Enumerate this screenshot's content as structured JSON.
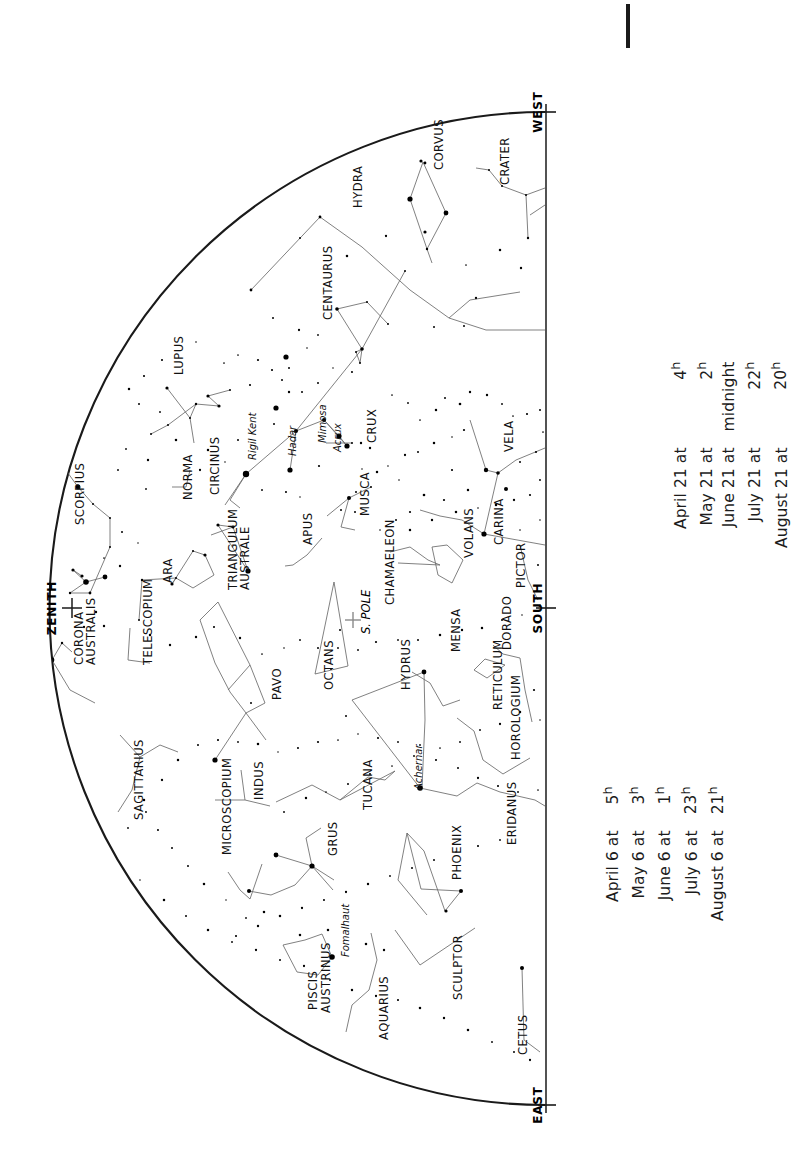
{
  "chart": {
    "compass": {
      "west": "WEST",
      "south": "SOUTH",
      "east": "EAST"
    },
    "zenith_label": "ZENITH",
    "pole_label": "S. POLE",
    "horizon_line_color": "#1a1a1a",
    "star_color": "#000000",
    "constellation_line_color": "#555555"
  },
  "constellations": [
    {
      "name": "HYDRA",
      "x": 362,
      "y": 208,
      "rot": -90
    },
    {
      "name": "CORVUS",
      "x": 443,
      "y": 170,
      "rot": -90
    },
    {
      "name": "CRATER",
      "x": 509,
      "y": 185,
      "rot": -90
    },
    {
      "name": "CENTAURUS",
      "x": 332,
      "y": 320,
      "rot": -90
    },
    {
      "name": "LUPUS",
      "x": 183,
      "y": 375,
      "rot": -90
    },
    {
      "name": "CRUX",
      "x": 376,
      "y": 443,
      "rot": -90
    },
    {
      "name": "MUSCA",
      "x": 369,
      "y": 516,
      "rot": -90
    },
    {
      "name": "CIRCINUS",
      "x": 219,
      "y": 495,
      "rot": -90
    },
    {
      "name": "NORMA",
      "x": 192,
      "y": 500,
      "rot": -90
    },
    {
      "name": "SCORPIUS",
      "x": 84,
      "y": 525,
      "rot": -90
    },
    {
      "name": "CORONA",
      "x": 83,
      "y": 665,
      "rot": -90
    },
    {
      "name": "AUSTRALIS",
      "x": 95,
      "y": 665,
      "rot": -90
    },
    {
      "name": "ARA",
      "x": 172,
      "y": 583,
      "rot": -90
    },
    {
      "name": "TELESCOPIUM",
      "x": 152,
      "y": 665,
      "rot": -90
    },
    {
      "name": "TRIANGULUM",
      "x": 237,
      "y": 590,
      "rot": -90
    },
    {
      "name": "AUSTRALE",
      "x": 249,
      "y": 590,
      "rot": -90
    },
    {
      "name": "APUS",
      "x": 312,
      "y": 545,
      "rot": -90
    },
    {
      "name": "CHAMAELEON",
      "x": 394,
      "y": 605,
      "rot": -90
    },
    {
      "name": "VELA",
      "x": 513,
      "y": 452,
      "rot": -90
    },
    {
      "name": "CARINA",
      "x": 503,
      "y": 545,
      "rot": -90
    },
    {
      "name": "VOLANS",
      "x": 473,
      "y": 558,
      "rot": -90
    },
    {
      "name": "PICTOR",
      "x": 525,
      "y": 588,
      "rot": -90
    },
    {
      "name": "MENSA",
      "x": 460,
      "y": 652,
      "rot": -90
    },
    {
      "name": "DORADO",
      "x": 511,
      "y": 650,
      "rot": -90
    },
    {
      "name": "HYDRUS",
      "x": 410,
      "y": 690,
      "rot": -90
    },
    {
      "name": "RETICULUM",
      "x": 502,
      "y": 710,
      "rot": -90
    },
    {
      "name": "HOROLOGIUM",
      "x": 520,
      "y": 760,
      "rot": -90
    },
    {
      "name": "ERIDANUS",
      "x": 516,
      "y": 845,
      "rot": -90
    },
    {
      "name": "OCTANS",
      "x": 333,
      "y": 690,
      "rot": -90
    },
    {
      "name": "PAVO",
      "x": 281,
      "y": 700,
      "rot": -90
    },
    {
      "name": "INDUS",
      "x": 263,
      "y": 800,
      "rot": -90
    },
    {
      "name": "TUCANA",
      "x": 372,
      "y": 810,
      "rot": -90
    },
    {
      "name": "MICROSCOPIUM",
      "x": 231,
      "y": 855,
      "rot": -90
    },
    {
      "name": "GRUS",
      "x": 337,
      "y": 856,
      "rot": -90
    },
    {
      "name": "SAGITTARIUS",
      "x": 143,
      "y": 820,
      "rot": -90
    },
    {
      "name": "PHOENIX",
      "x": 461,
      "y": 880,
      "rot": -90
    },
    {
      "name": "PISCIS",
      "x": 317,
      "y": 1010,
      "rot": -90
    },
    {
      "name": "AUSTRINUS",
      "x": 330,
      "y": 1013,
      "rot": -90
    },
    {
      "name": "AQUARIUS",
      "x": 388,
      "y": 1040,
      "rot": -90
    },
    {
      "name": "SCULPTOR",
      "x": 462,
      "y": 1000,
      "rot": -90
    },
    {
      "name": "CETUS",
      "x": 527,
      "y": 1055,
      "rot": -90
    }
  ],
  "named_stars": [
    {
      "name": "Rigil Kent",
      "x": 256,
      "y": 460
    },
    {
      "name": "Hadar",
      "x": 296,
      "y": 456
    },
    {
      "name": "Mimosa",
      "x": 326,
      "y": 443
    },
    {
      "name": "Acrux",
      "x": 341,
      "y": 452
    },
    {
      "name": "Achernar",
      "x": 422,
      "y": 790
    },
    {
      "name": "Fomalhaut",
      "x": 349,
      "y": 957
    }
  ],
  "legend": {
    "upper": {
      "rows": [
        {
          "date": "April 21 at",
          "time": "4",
          "suffix": "h"
        },
        {
          "date": "May 21 at",
          "time": "2",
          "suffix": "h"
        },
        {
          "date": "June 21 at",
          "time": "midnight",
          "suffix": ""
        },
        {
          "date": "July 21 at",
          "time": "22",
          "suffix": "h"
        },
        {
          "date": "August 21 at",
          "time": "20",
          "suffix": "h"
        }
      ]
    },
    "lower": {
      "rows": [
        {
          "date": "April 6 at",
          "time": "5",
          "suffix": "h"
        },
        {
          "date": "May 6 at",
          "time": "3",
          "suffix": "h"
        },
        {
          "date": "June 6 at",
          "time": "1",
          "suffix": "h"
        },
        {
          "date": "July 6 at",
          "time": "23",
          "suffix": "h"
        },
        {
          "date": "August 6 at",
          "time": "21",
          "suffix": "h"
        }
      ]
    }
  },
  "chart_data": {
    "type": "scatter",
    "xlabel": "",
    "ylabel": "",
    "note": "Semicircular all-sky map; horizon is the straight right edge running WEST (top) to EAST (bottom); SOUTH at its midpoint. ZENITH is marked on the curved western/left limb.",
    "stars": [
      {
        "x": 320,
        "y": 217,
        "mag": 1.4
      },
      {
        "x": 421,
        "y": 161,
        "mag": 1.6
      },
      {
        "x": 425,
        "y": 163,
        "mag": 1.4
      },
      {
        "x": 446,
        "y": 213,
        "mag": 2.4
      },
      {
        "x": 410,
        "y": 199,
        "mag": 2.6
      },
      {
        "x": 425,
        "y": 232,
        "mag": 1.6
      },
      {
        "x": 427,
        "y": 249,
        "mag": 1.2
      },
      {
        "x": 251,
        "y": 290,
        "mag": 1.4
      },
      {
        "x": 489,
        "y": 170,
        "mag": 1.0
      },
      {
        "x": 502,
        "y": 186,
        "mag": 1.0
      },
      {
        "x": 526,
        "y": 195,
        "mag": 1.0
      },
      {
        "x": 528,
        "y": 238,
        "mag": 1.2
      },
      {
        "x": 548,
        "y": 238,
        "mag": 1.0
      },
      {
        "x": 434,
        "y": 327,
        "mag": 1.0
      },
      {
        "x": 464,
        "y": 326,
        "mag": 1.0
      },
      {
        "x": 388,
        "y": 324,
        "mag": 1.0
      },
      {
        "x": 337,
        "y": 309,
        "mag": 1.8
      },
      {
        "x": 367,
        "y": 302,
        "mag": 1.0
      },
      {
        "x": 405,
        "y": 271,
        "mag": 1.0
      },
      {
        "x": 356,
        "y": 352,
        "mag": 1.0
      },
      {
        "x": 362,
        "y": 349,
        "mag": 1.8
      },
      {
        "x": 360,
        "y": 363,
        "mag": 1.0
      },
      {
        "x": 286,
        "y": 357,
        "mag": 2.6
      },
      {
        "x": 289,
        "y": 368,
        "mag": 1.0
      },
      {
        "x": 282,
        "y": 380,
        "mag": 1.0
      },
      {
        "x": 276,
        "y": 408,
        "mag": 2.6
      },
      {
        "x": 274,
        "y": 424,
        "mag": 1.0
      },
      {
        "x": 230,
        "y": 390,
        "mag": 1.0
      },
      {
        "x": 208,
        "y": 396,
        "mag": 1.6
      },
      {
        "x": 219,
        "y": 406,
        "mag": 1.6
      },
      {
        "x": 196,
        "y": 404,
        "mag": 1.2
      },
      {
        "x": 190,
        "y": 418,
        "mag": 1.0
      },
      {
        "x": 167,
        "y": 388,
        "mag": 1.6
      },
      {
        "x": 139,
        "y": 404,
        "mag": 1.0
      },
      {
        "x": 168,
        "y": 425,
        "mag": 1.0
      },
      {
        "x": 151,
        "y": 434,
        "mag": 1.0
      },
      {
        "x": 238,
        "y": 440,
        "mag": 1.0
      },
      {
        "x": 246,
        "y": 474,
        "mag": 3.2
      },
      {
        "x": 290,
        "y": 470,
        "mag": 2.6
      },
      {
        "x": 296,
        "y": 431,
        "mag": 2.0
      },
      {
        "x": 324,
        "y": 420,
        "mag": 2.0
      },
      {
        "x": 339,
        "y": 436,
        "mag": 2.6
      },
      {
        "x": 347,
        "y": 446,
        "mag": 2.6
      },
      {
        "x": 352,
        "y": 443,
        "mag": 1.0
      },
      {
        "x": 361,
        "y": 443,
        "mag": 1.2
      },
      {
        "x": 370,
        "y": 448,
        "mag": 1.2
      },
      {
        "x": 349,
        "y": 498,
        "mag": 2.0
      },
      {
        "x": 356,
        "y": 492,
        "mag": 1.0
      },
      {
        "x": 371,
        "y": 487,
        "mag": 1.0
      },
      {
        "x": 341,
        "y": 510,
        "mag": 1.0
      },
      {
        "x": 355,
        "y": 512,
        "mag": 1.0
      },
      {
        "x": 78,
        "y": 487,
        "mag": 2.4
      },
      {
        "x": 93,
        "y": 504,
        "mag": 1.0
      },
      {
        "x": 110,
        "y": 518,
        "mag": 1.0
      },
      {
        "x": 110,
        "y": 547,
        "mag": 1.0
      },
      {
        "x": 73,
        "y": 570,
        "mag": 1.6
      },
      {
        "x": 82,
        "y": 576,
        "mag": 1.6
      },
      {
        "x": 86,
        "y": 582,
        "mag": 2.8
      },
      {
        "x": 105,
        "y": 577,
        "mag": 2.4
      },
      {
        "x": 90,
        "y": 593,
        "mag": 1.4
      },
      {
        "x": 70,
        "y": 593,
        "mag": 1.2
      },
      {
        "x": 52,
        "y": 660,
        "mag": 2.4
      },
      {
        "x": 62,
        "y": 643,
        "mag": 1.2
      },
      {
        "x": 193,
        "y": 551,
        "mag": 1.0
      },
      {
        "x": 205,
        "y": 555,
        "mag": 1.6
      },
      {
        "x": 176,
        "y": 578,
        "mag": 1.0
      },
      {
        "x": 172,
        "y": 584,
        "mag": 1.6
      },
      {
        "x": 142,
        "y": 580,
        "mag": 1.2
      },
      {
        "x": 139,
        "y": 620,
        "mag": 1.0
      },
      {
        "x": 218,
        "y": 525,
        "mag": 1.6
      },
      {
        "x": 233,
        "y": 527,
        "mag": 1.6
      },
      {
        "x": 248,
        "y": 571,
        "mag": 2.6
      },
      {
        "x": 215,
        "y": 760,
        "mag": 2.6
      },
      {
        "x": 251,
        "y": 703,
        "mag": 1.0
      },
      {
        "x": 340,
        "y": 630,
        "mag": 1.0
      },
      {
        "x": 346,
        "y": 716,
        "mag": 1.0
      },
      {
        "x": 331,
        "y": 669,
        "mag": 1.0
      },
      {
        "x": 424,
        "y": 672,
        "mag": 2.4
      },
      {
        "x": 420,
        "y": 788,
        "mag": 2.8
      },
      {
        "x": 332,
        "y": 957,
        "mag": 2.8
      },
      {
        "x": 276,
        "y": 855,
        "mag": 2.4
      },
      {
        "x": 312,
        "y": 866,
        "mag": 2.6
      },
      {
        "x": 249,
        "y": 891,
        "mag": 2.0
      },
      {
        "x": 522,
        "y": 968,
        "mag": 2.0
      },
      {
        "x": 484,
        "y": 534,
        "mag": 2.6
      },
      {
        "x": 506,
        "y": 489,
        "mag": 2.0
      },
      {
        "x": 486,
        "y": 470,
        "mag": 2.2
      },
      {
        "x": 498,
        "y": 473,
        "mag": 1.8
      },
      {
        "x": 461,
        "y": 891,
        "mag": 2.0
      },
      {
        "x": 446,
        "y": 911,
        "mag": 1.6
      }
    ]
  }
}
